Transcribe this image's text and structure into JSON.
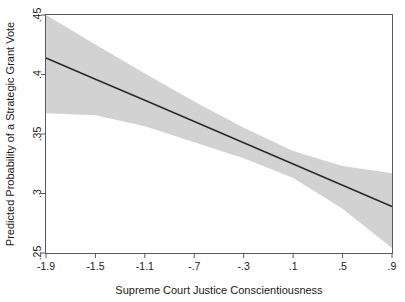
{
  "chart_data": {
    "type": "line",
    "title": "",
    "subtitle": "",
    "xlabel": "Supreme Court Justice Conscientiousness",
    "ylabel": "Predicted Probability of a Strategic Grant Vote",
    "xlim": [
      -1.9,
      0.9
    ],
    "ylim": [
      0.25,
      0.45
    ],
    "xticks": [
      -1.9,
      -1.5,
      -1.1,
      -0.7,
      -0.3,
      0.1,
      0.5,
      0.9
    ],
    "xticklabels": [
      "-1.9",
      "-1.5",
      "-1.1",
      "-.7",
      "-.3",
      ".1",
      ".5",
      ".9"
    ],
    "yticks": [
      0.25,
      0.3,
      0.35,
      0.4,
      0.45
    ],
    "yticklabels": [
      ".25",
      ".3",
      ".35",
      ".4",
      ".45"
    ],
    "grid": false,
    "legend": null,
    "annotations": [],
    "series": [
      {
        "name": "Predicted probability (fitted)",
        "kind": "line",
        "color": "#2b2b2b",
        "x": [
          -1.9,
          -1.5,
          -1.1,
          -0.7,
          -0.3,
          0.1,
          0.5,
          0.9
        ],
        "values": [
          0.4139,
          0.3961,
          0.3783,
          0.3605,
          0.3426,
          0.3248,
          0.307,
          0.2891
        ]
      },
      {
        "name": "95% confidence interval",
        "kind": "band",
        "color": "#d2d2d2",
        "x": [
          -1.9,
          -1.5,
          -1.1,
          -0.7,
          -0.3,
          0.1,
          0.5,
          0.9
        ],
        "upper": [
          0.45,
          0.4252,
          0.4009,
          0.3774,
          0.3552,
          0.3357,
          0.3232,
          0.317
        ],
        "lower": [
          0.3674,
          0.3657,
          0.3565,
          0.3431,
          0.3296,
          0.3131,
          0.2871,
          0.2543
        ]
      }
    ]
  },
  "axes": {
    "x_title": "Supreme Court Justice Conscientiousness",
    "y_title": "Predicted Probability of a Strategic Grant Vote"
  },
  "colors": {
    "band": "#d2d2d2",
    "line": "#2b2b2b",
    "frame": "#5a5a5a",
    "text": "#1a1a1a",
    "background": "#ffffff"
  }
}
